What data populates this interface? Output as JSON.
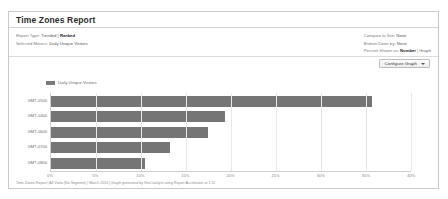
{
  "report": {
    "title": "Time Zones Report",
    "meta_left": [
      {
        "label": "Report Type:",
        "value": "Trended |",
        "value_strong": "Ranked"
      },
      {
        "label": "Selected Metrics:",
        "value": "Daily Unique Visitors",
        "value_strong": ""
      }
    ],
    "meta_right": [
      {
        "label": "Compare to Site:",
        "value": "None",
        "value_strong": "",
        "sep": "",
        "link": ""
      },
      {
        "label": "Broken Down by:",
        "value": "None",
        "value_strong": "",
        "sep": "",
        "link": ""
      },
      {
        "label": "Percent Shown as:",
        "value": "",
        "value_strong": "Number",
        "sep": "|",
        "link": "Graph"
      }
    ],
    "configure_button": "Configure Graph",
    "footer": "Time Zones Report | All Visits (No Segment) | March 2010 | Graph generated by SiteCatalyst using Report Accelerator at 1:11"
  },
  "chart_data": {
    "type": "bar",
    "orientation": "horizontal",
    "title": "Time Zones Report",
    "xlabel": "",
    "ylabel": "",
    "categories": [
      "GMT-0500",
      "GMT-0400",
      "GMT-0600",
      "GMT-0700",
      "GMT-0800"
    ],
    "values": [
      35.7,
      19.3,
      17.4,
      13.2,
      10.4
    ],
    "xlim": [
      0,
      40
    ],
    "xticks": [
      "0%",
      "5%",
      "10%",
      "15%",
      "20%",
      "25%",
      "30%",
      "35%",
      "40%"
    ],
    "xtick_values": [
      0,
      5,
      10,
      15,
      20,
      25,
      30,
      35,
      40
    ],
    "grid": true,
    "legend": [
      "Daily Unique Visitors"
    ],
    "legend_position": "top-left",
    "series_color": "#757575"
  }
}
